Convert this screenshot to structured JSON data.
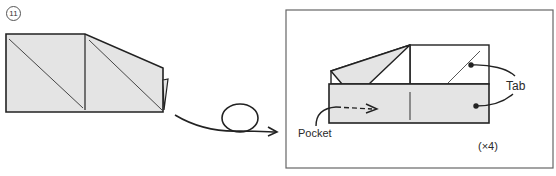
{
  "step": {
    "number": "11"
  },
  "labels": {
    "tab": "Tab",
    "pocket": "Pocket",
    "repeat": "(×4)"
  },
  "colors": {
    "paper_fill": "#e4e4e4",
    "line": "#222222",
    "background": "#ffffff"
  }
}
